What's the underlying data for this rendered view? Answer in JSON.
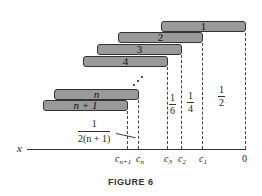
{
  "figure": {
    "caption": "FIGURE 6",
    "axis_label": "x",
    "bars": [
      {
        "label": "1"
      },
      {
        "label": "2"
      },
      {
        "label": "3"
      },
      {
        "label": "4"
      },
      {
        "label": "n"
      },
      {
        "label": "n + 1"
      }
    ],
    "gap_labels": [
      {
        "numerator": "1",
        "denominator": "2"
      },
      {
        "numerator": "1",
        "denominator": "4"
      },
      {
        "numerator": "1",
        "denominator": "6"
      },
      {
        "numerator": "1",
        "denominator": "2(n + 1)"
      }
    ],
    "ticks": [
      {
        "base": "c",
        "sub": "n+1"
      },
      {
        "base": "c",
        "sub": "n"
      },
      {
        "base": "c",
        "sub": "3"
      },
      {
        "base": "c",
        "sub": "2"
      },
      {
        "base": "c",
        "sub": "1"
      },
      {
        "base": "0",
        "sub": ""
      }
    ],
    "colors": {
      "bar_fill": "#9a9a9a",
      "bar_border": "#333333",
      "line": "#333333"
    }
  }
}
